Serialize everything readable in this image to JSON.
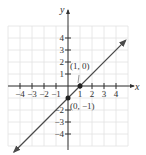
{
  "chart_data": {
    "type": "line",
    "title": "",
    "xlabel": "x",
    "ylabel": "y",
    "xlim": [
      -5,
      5
    ],
    "ylim": [
      -5,
      5
    ],
    "grid": true,
    "x_ticks": [
      -4,
      -3,
      -2,
      -1,
      1,
      2,
      3,
      4
    ],
    "y_ticks": [
      4,
      3,
      2,
      1,
      -2,
      -3,
      -4
    ],
    "x_tick_labels": [
      "−4",
      "−3",
      "−2",
      "−1",
      "1",
      "2",
      "3",
      "4"
    ],
    "y_tick_labels": [
      "4",
      "3",
      "2",
      "1",
      "−2",
      "−3",
      "−4"
    ],
    "series": [
      {
        "name": "y = x − 1",
        "x": [
          -4.5,
          0,
          1,
          4.8
        ],
        "y": [
          -5.5,
          -1,
          0,
          3.8
        ],
        "arrows_both_ends": true
      }
    ],
    "points": [
      {
        "x": 1,
        "y": 0,
        "label": "(1, 0)"
      },
      {
        "x": 0,
        "y": -1,
        "label": "(0, −1)"
      }
    ],
    "colors": {
      "line": "#4a4a4a",
      "axis": "#333333",
      "grid": "#e2e2e2"
    }
  }
}
